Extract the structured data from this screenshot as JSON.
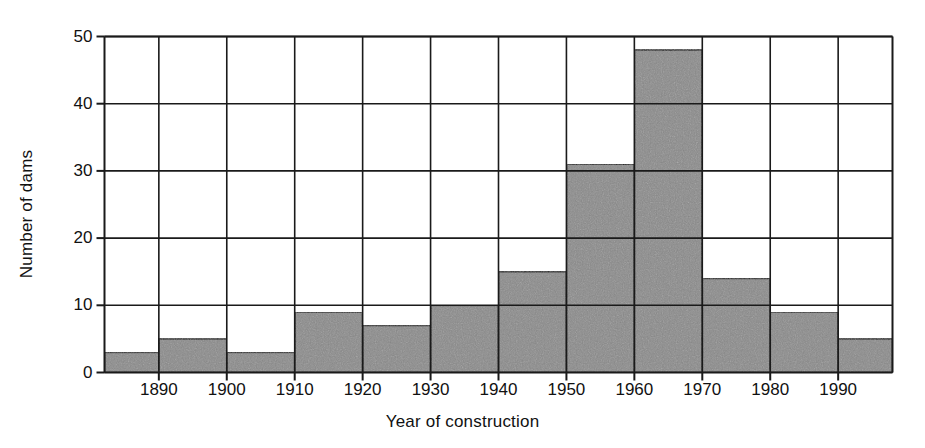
{
  "chart_data": {
    "type": "bar",
    "title": "",
    "subtitle": "",
    "xlabel": "Year of construction",
    "ylabel": "Number of dams",
    "categories": [
      "1882-1890",
      "1890-1900",
      "1900-1910",
      "1910-1920",
      "1920-1930",
      "1930-1940",
      "1940-1950",
      "1950-1960",
      "1960-1970",
      "1970-1980",
      "1980-1990",
      "1990-1998"
    ],
    "bin_edges": [
      1882,
      1890,
      1900,
      1910,
      1920,
      1930,
      1940,
      1950,
      1960,
      1970,
      1980,
      1990,
      1998
    ],
    "values": [
      3,
      5,
      3,
      9,
      7,
      10,
      15,
      31,
      48,
      14,
      9,
      5
    ],
    "xlim": [
      1882,
      1998
    ],
    "ylim": [
      0,
      50
    ],
    "ytick_values": [
      0,
      10,
      20,
      30,
      40,
      50
    ],
    "ytick_labels": [
      "0",
      "10",
      "20",
      "30",
      "40",
      "50"
    ],
    "xtick_values": [
      1890,
      1900,
      1910,
      1920,
      1930,
      1940,
      1950,
      1960,
      1970,
      1980,
      1990
    ],
    "xtick_labels": [
      "1890",
      "1900",
      "1910",
      "1920",
      "1930",
      "1940",
      "1950",
      "1960",
      "1970",
      "1980",
      "1990"
    ],
    "grid": "horizontal-and-vertical",
    "legend": "none",
    "bar_fill_color": "#8a8a8a",
    "bar_edge_color": "#1a1a1a",
    "grid_color": "#1a1a1a",
    "axis_color": "#1a1a1a",
    "background_color": "#ffffff",
    "annotations": []
  }
}
